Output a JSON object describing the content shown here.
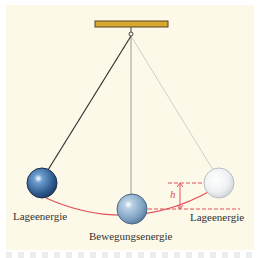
{
  "diagram": {
    "labels": {
      "left": "Lageenergie",
      "center": "Bewegungsenergie",
      "right": "Lageenergie",
      "height_symbol": "h"
    },
    "colors": {
      "background": "#fdf9e8",
      "beam": "#d9a72e",
      "ball_left": "#3a6fa8",
      "ball_center": "#8fb3d0",
      "ball_right": "#e8ecef",
      "arc": "#e0505a"
    }
  }
}
